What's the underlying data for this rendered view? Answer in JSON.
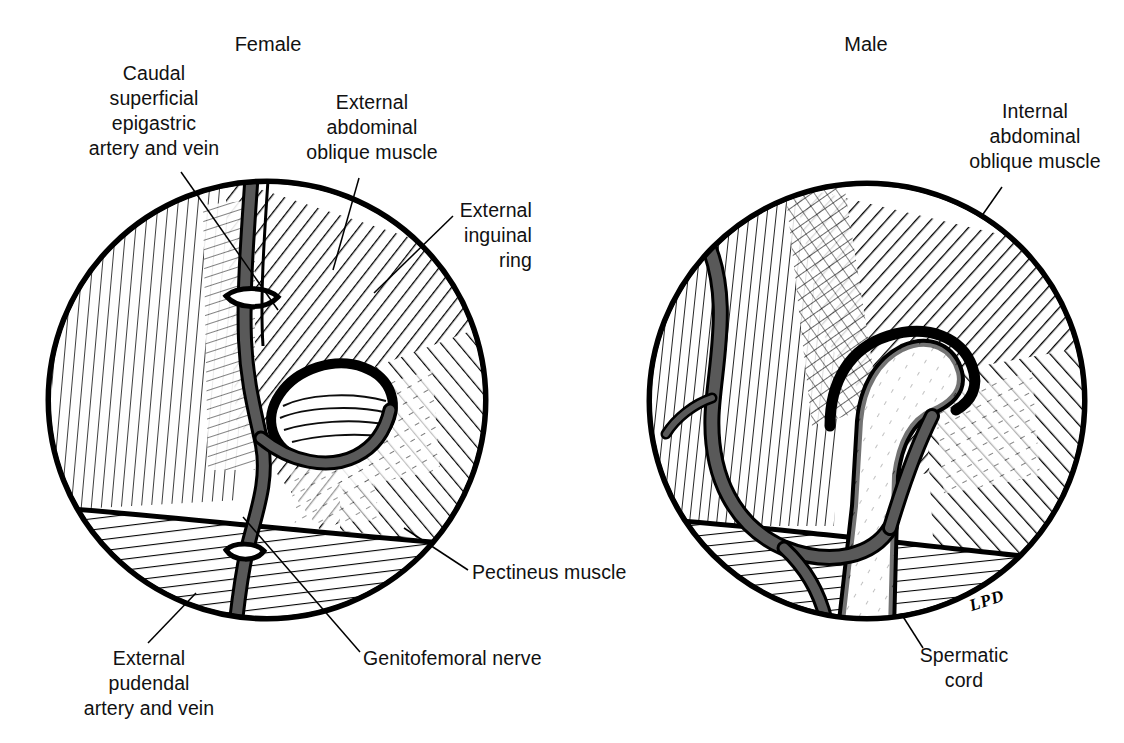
{
  "figure": {
    "type": "anatomical-illustration",
    "background_color": "#ffffff",
    "ink_color": "#000000",
    "vessel_fill_color": "#595959",
    "signature": "LPD"
  },
  "panels": [
    {
      "id": "female",
      "title": "Female",
      "title_x": 268,
      "title_y": 32,
      "circle": {
        "cx": 267,
        "cy": 400,
        "r": 221
      }
    },
    {
      "id": "male",
      "title": "Male",
      "title_x": 866,
      "title_y": 32,
      "circle": {
        "cx": 866,
        "cy": 400,
        "r": 218
      }
    }
  ],
  "labels": [
    {
      "id": "caudal-superficial-epigastric",
      "text": "Caudal\nsuperficial\nepigastric\nartery and vein",
      "align": "center",
      "x": 63,
      "y": 61,
      "width": 182,
      "leader": {
        "x1": 181,
        "y1": 172,
        "x2": 278,
        "y2": 310
      }
    },
    {
      "id": "external-abdominal-oblique-muscle",
      "text": "External\nabdominal\noblique muscle",
      "align": "center",
      "x": 282,
      "y": 90,
      "width": 180,
      "leader": {
        "x1": 359,
        "y1": 178,
        "x2": 333,
        "y2": 270
      }
    },
    {
      "id": "external-inguinal-ring",
      "text": "External\ninguinal\nring",
      "align": "right",
      "x": 414,
      "y": 198,
      "width": 118,
      "leader": {
        "x1": 453,
        "y1": 216,
        "x2": 374,
        "y2": 293
      }
    },
    {
      "id": "pectineus-muscle",
      "text": "Pectineus muscle",
      "align": "left",
      "x": 472,
      "y": 560,
      "width": 170,
      "leader": {
        "x1": 468,
        "y1": 570,
        "x2": 404,
        "y2": 528
      }
    },
    {
      "id": "genitofemoral-nerve",
      "text": "Genitofemoral nerve",
      "align": "left",
      "x": 363,
      "y": 646,
      "width": 210,
      "leader": {
        "x1": 360,
        "y1": 652,
        "x2": 243,
        "y2": 517
      }
    },
    {
      "id": "external-pudendal-artery-and-vein",
      "text": "External\npudendal\nartery and vein",
      "align": "center",
      "x": 59,
      "y": 646,
      "width": 180,
      "leader": {
        "x1": 148,
        "y1": 643,
        "x2": 196,
        "y2": 593
      }
    },
    {
      "id": "internal-abdominal-oblique-muscle",
      "text": "Internal\nabdominal\noblique muscle",
      "align": "center",
      "x": 946,
      "y": 99,
      "width": 178,
      "leader": {
        "x1": 1002,
        "y1": 187,
        "x2": 965,
        "y2": 240
      }
    },
    {
      "id": "spermatic-cord",
      "text": "Spermatic\ncord",
      "align": "center",
      "x": 890,
      "y": 643,
      "width": 148,
      "leader": {
        "x1": 923,
        "y1": 648,
        "x2": 846,
        "y2": 527
      }
    }
  ],
  "signature": {
    "text": "LPD",
    "x": 969,
    "y": 591
  }
}
